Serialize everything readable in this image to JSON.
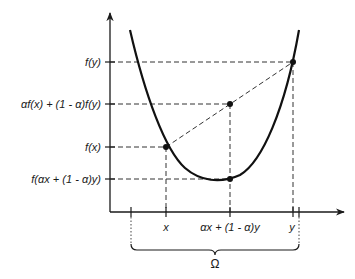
{
  "figure": {
    "y_labels": {
      "fy": "f(y)",
      "combo": "αf(x) + (1 - α)f(y)",
      "fx": "f(x)",
      "fcombo": "f(αx + (1 - α)y)"
    },
    "x_labels": {
      "x": "x",
      "combo": "αx + (1 - α)y",
      "y": "y"
    },
    "domain_label": "Ω",
    "colors": {
      "ink": "#111111",
      "background": "#ffffff"
    }
  }
}
